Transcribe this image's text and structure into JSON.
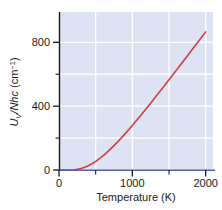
{
  "chart_data": {
    "type": "line",
    "title": "",
    "subtitle": "",
    "xlabel": "Temperature (K)",
    "ylabel": "Uv/Nhc (cm-1)",
    "ylabel_parts": {
      "symbol": "U",
      "subscript": "V",
      "divider": "/",
      "denominator": "Nhc",
      "units_open": " (cm",
      "units_exponent": "−1",
      "units_close": ")"
    },
    "xlim": [
      0,
      2100
    ],
    "ylim": [
      0,
      990
    ],
    "grid": true,
    "grid_color": "#ffffff",
    "plot_background": "#dde3f2",
    "legend": "none",
    "xticks_major": [
      0,
      1000,
      2000
    ],
    "xtick_labels": [
      "0",
      "1000",
      "2000"
    ],
    "xticks_minor": [
      500,
      1500
    ],
    "yticks_major": [
      0,
      400,
      800
    ],
    "ytick_labels": [
      "0",
      "400",
      "800"
    ],
    "yticks_minor": [
      200,
      600
    ],
    "series": [
      {
        "name": "Vibrational internal energy",
        "color": "#cf413d",
        "line_width": 1.6,
        "x": [
          0,
          50,
          100,
          150,
          200,
          250,
          300,
          350,
          400,
          450,
          500,
          550,
          600,
          650,
          700,
          750,
          800,
          850,
          900,
          950,
          1000,
          1050,
          1100,
          1150,
          1200,
          1250,
          1300,
          1350,
          1400,
          1450,
          1500,
          1550,
          1600,
          1650,
          1700,
          1750,
          1800,
          1850,
          1900,
          1950,
          2000
        ],
        "y": [
          0,
          0,
          0,
          0.4,
          1.6,
          4.5,
          9.5,
          17,
          27,
          39.5,
          54,
          70.5,
          89,
          109,
          130.5,
          153,
          176.5,
          201,
          226.5,
          252.5,
          279,
          306.5,
          334,
          362,
          390.5,
          419,
          448,
          477,
          506.5,
          536,
          565.5,
          595,
          625,
          655,
          685,
          715,
          745,
          775,
          805,
          835,
          865
        ]
      }
    ],
    "axis_line_color_x": "#5b5fa8",
    "axis_line_color_y": "#1a1a1a"
  }
}
